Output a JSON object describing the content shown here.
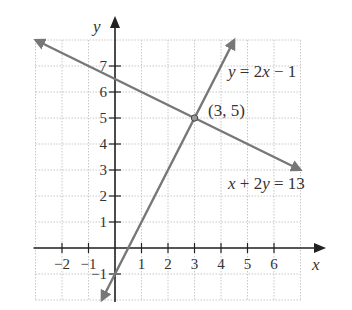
{
  "chart_data": {
    "type": "line",
    "title": "",
    "xlabel": "x",
    "ylabel": "y",
    "xlim": [
      -3,
      7
    ],
    "ylim": [
      -2,
      8
    ],
    "grid": true,
    "x_ticks": [
      "−2",
      "−1",
      "1",
      "2",
      "3",
      "4",
      "5",
      "6"
    ],
    "x_tick_values": [
      -2,
      -1,
      1,
      2,
      3,
      4,
      5,
      6
    ],
    "y_ticks": [
      "−1",
      "1",
      "2",
      "3",
      "4",
      "5",
      "6",
      "7"
    ],
    "y_tick_values": [
      -1,
      1,
      2,
      3,
      4,
      5,
      6,
      7
    ],
    "series": [
      {
        "name": "y = 2x − 1",
        "equation": "y = 2x − 1",
        "x": [
          -0.5,
          4.5
        ],
        "y": [
          -2,
          8
        ],
        "color": "#777777"
      },
      {
        "name": "x + 2y = 13",
        "equation": "x + 2y = 13",
        "x": [
          -3,
          7
        ],
        "y": [
          8,
          3
        ],
        "color": "#777777"
      }
    ],
    "annotations": [
      {
        "text": "(3, 5)",
        "x": 3,
        "y": 5,
        "type": "intersection-point"
      }
    ]
  },
  "labels": {
    "x_axis": "x",
    "y_axis": "y",
    "line1": "y = 2x − 1",
    "line2": "x + 2y = 13",
    "point": "(3, 5)"
  }
}
